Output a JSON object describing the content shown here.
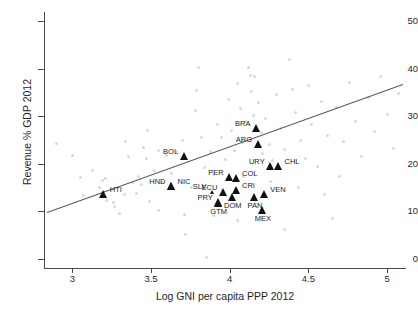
{
  "chart_data": {
    "type": "scatter",
    "title": "",
    "xlabel": "Log GNI per capita PPP 2012",
    "ylabel": "Revenue % GDP 2012",
    "xlim": [
      2.82,
      5.12
    ],
    "ylim": [
      -2.0,
      52.0
    ],
    "xticks": [
      3,
      3.5,
      4,
      4.5,
      5
    ],
    "xticklabels": [
      "3",
      "3.5",
      "4",
      "4.5",
      "5"
    ],
    "yticks": [
      0,
      10,
      20,
      30,
      40,
      50
    ],
    "yticklabels": [
      "0",
      "10",
      "20",
      "30",
      "40",
      "50"
    ],
    "grid": false,
    "legend": "none",
    "series": [
      {
        "name": "Latin America & Caribbean (labeled)",
        "marker": "triangle",
        "color": "#111111",
        "points": [
          {
            "label": "HTI",
            "x": 3.2,
            "y": 12.9,
            "label_pos": "right"
          },
          {
            "label": "BOL",
            "x": 3.71,
            "y": 21.0,
            "label_pos": "left"
          },
          {
            "label": "HND",
            "x": 3.63,
            "y": 14.7,
            "label_pos": "left"
          },
          {
            "label": "NIC",
            "x": 3.63,
            "y": 14.7,
            "label_pos": "right"
          },
          {
            "label": "SLV",
            "x": 3.89,
            "y": 13.6,
            "label_pos": "left",
            "size": "small"
          },
          {
            "label": "PRY",
            "x": 3.93,
            "y": 11.2,
            "label_pos": "left"
          },
          {
            "label": "GTM",
            "x": 3.93,
            "y": 11.0,
            "label_pos": "below"
          },
          {
            "label": "ECU",
            "x": 3.96,
            "y": 13.5,
            "label_pos": "left"
          },
          {
            "label": "PER",
            "x": 4.0,
            "y": 16.6,
            "label_pos": "left"
          },
          {
            "label": "COL",
            "x": 4.04,
            "y": 16.3,
            "label_pos": "right"
          },
          {
            "label": "CRI",
            "x": 4.04,
            "y": 13.8,
            "label_pos": "right"
          },
          {
            "label": "DOM",
            "x": 4.02,
            "y": 12.4,
            "label_pos": "below"
          },
          {
            "label": "BRA",
            "x": 4.17,
            "y": 26.9,
            "label_pos": "left"
          },
          {
            "label": "ARG",
            "x": 4.18,
            "y": 23.5,
            "label_pos": "left"
          },
          {
            "label": "URY",
            "x": 4.26,
            "y": 18.8,
            "label_pos": "left"
          },
          {
            "label": "CHL",
            "x": 4.31,
            "y": 18.8,
            "label_pos": "right"
          },
          {
            "label": "PAN",
            "x": 4.16,
            "y": 12.3,
            "label_pos": "below"
          },
          {
            "label": "VEN",
            "x": 4.22,
            "y": 13.0,
            "label_pos": "right"
          },
          {
            "label": "MEX",
            "x": 4.21,
            "y": 9.6,
            "label_pos": "below"
          }
        ]
      },
      {
        "name": "All other countries",
        "marker": "dot",
        "color": "#d8d8d8",
        "points": [
          {
            "x": 2.9,
            "y": 24.3
          },
          {
            "x": 3.0,
            "y": 21.7
          },
          {
            "x": 3.05,
            "y": 17.0
          },
          {
            "x": 3.07,
            "y": 13.2
          },
          {
            "x": 3.13,
            "y": 18.6
          },
          {
            "x": 3.17,
            "y": 15.0
          },
          {
            "x": 3.19,
            "y": 16.4
          },
          {
            "x": 3.21,
            "y": 16.8
          },
          {
            "x": 3.22,
            "y": 12.2
          },
          {
            "x": 3.26,
            "y": 11.9
          },
          {
            "x": 3.27,
            "y": 11.0
          },
          {
            "x": 3.3,
            "y": 9.6
          },
          {
            "x": 3.33,
            "y": 13.5
          },
          {
            "x": 3.36,
            "y": 21.5
          },
          {
            "x": 3.38,
            "y": 16.0
          },
          {
            "x": 3.41,
            "y": 13.8
          },
          {
            "x": 3.42,
            "y": 17.3
          },
          {
            "x": 3.44,
            "y": 15.6
          },
          {
            "x": 3.47,
            "y": 21.2
          },
          {
            "x": 3.49,
            "y": 12.0
          },
          {
            "x": 3.52,
            "y": 18.6
          },
          {
            "x": 3.55,
            "y": 10.2
          },
          {
            "x": 3.57,
            "y": 16.1
          },
          {
            "x": 3.6,
            "y": 21.7
          },
          {
            "x": 3.63,
            "y": 17.9
          },
          {
            "x": 3.66,
            "y": 22.5
          },
          {
            "x": 3.7,
            "y": 24.9
          },
          {
            "x": 3.72,
            "y": 5.0
          },
          {
            "x": 3.76,
            "y": 14.9
          },
          {
            "x": 3.78,
            "y": 31.3
          },
          {
            "x": 3.79,
            "y": 35.4
          },
          {
            "x": 3.8,
            "y": 40.2
          },
          {
            "x": 3.82,
            "y": 25.6
          },
          {
            "x": 3.84,
            "y": 19.1
          },
          {
            "x": 3.85,
            "y": 0.3
          },
          {
            "x": 3.88,
            "y": 22.5
          },
          {
            "x": 3.9,
            "y": 17.8
          },
          {
            "x": 3.92,
            "y": 28.2
          },
          {
            "x": 3.95,
            "y": 25.5
          },
          {
            "x": 3.97,
            "y": 20.9
          },
          {
            "x": 3.99,
            "y": 33.5
          },
          {
            "x": 4.01,
            "y": 27.0
          },
          {
            "x": 4.03,
            "y": 22.8
          },
          {
            "x": 4.05,
            "y": 37.0
          },
          {
            "x": 4.07,
            "y": 31.6
          },
          {
            "x": 4.08,
            "y": 24.4
          },
          {
            "x": 4.1,
            "y": 28.8
          },
          {
            "x": 4.12,
            "y": 40.3
          },
          {
            "x": 4.13,
            "y": 38.7
          },
          {
            "x": 4.14,
            "y": 35.2
          },
          {
            "x": 4.15,
            "y": 30.1
          },
          {
            "x": 4.16,
            "y": 38.3
          },
          {
            "x": 4.18,
            "y": 33.0
          },
          {
            "x": 4.2,
            "y": 26.6
          },
          {
            "x": 4.21,
            "y": 22.2
          },
          {
            "x": 4.23,
            "y": 29.5
          },
          {
            "x": 4.25,
            "y": 24.0
          },
          {
            "x": 4.27,
            "y": 20.6
          },
          {
            "x": 4.3,
            "y": 34.5
          },
          {
            "x": 4.32,
            "y": 27.4
          },
          {
            "x": 4.35,
            "y": 23.1
          },
          {
            "x": 4.38,
            "y": 41.9
          },
          {
            "x": 4.4,
            "y": 35.7
          },
          {
            "x": 4.42,
            "y": 30.9
          },
          {
            "x": 4.45,
            "y": 24.8
          },
          {
            "x": 4.48,
            "y": 21.0
          },
          {
            "x": 4.5,
            "y": 36.4
          },
          {
            "x": 4.52,
            "y": 28.3
          },
          {
            "x": 4.56,
            "y": 19.4
          },
          {
            "x": 4.58,
            "y": 33.1
          },
          {
            "x": 4.62,
            "y": 26.0
          },
          {
            "x": 4.65,
            "y": 8.4
          },
          {
            "x": 4.68,
            "y": 31.8
          },
          {
            "x": 4.72,
            "y": 24.6
          },
          {
            "x": 4.76,
            "y": 37.2
          },
          {
            "x": 4.8,
            "y": 29.0
          },
          {
            "x": 4.84,
            "y": 21.5
          },
          {
            "x": 4.88,
            "y": 34.0
          },
          {
            "x": 4.92,
            "y": 26.8
          },
          {
            "x": 4.96,
            "y": 38.5
          },
          {
            "x": 5.0,
            "y": 30.4
          },
          {
            "x": 5.04,
            "y": 23.2
          },
          {
            "x": 5.07,
            "y": 34.8
          },
          {
            "x": 3.34,
            "y": 24.6
          },
          {
            "x": 3.45,
            "y": 23.4
          },
          {
            "x": 4.09,
            "y": 17.3
          },
          {
            "x": 4.26,
            "y": 16.2
          },
          {
            "x": 4.44,
            "y": 15.0
          },
          {
            "x": 4.6,
            "y": 13.6
          },
          {
            "x": 4.7,
            "y": 17.2
          },
          {
            "x": 3.9,
            "y": 9.0
          },
          {
            "x": 3.71,
            "y": 9.2
          },
          {
            "x": 4.35,
            "y": 6.2
          },
          {
            "x": 4.05,
            "y": 8.1
          },
          {
            "x": 3.55,
            "y": 22.8
          },
          {
            "x": 3.48,
            "y": 27.0
          }
        ]
      }
    ],
    "fit_line": {
      "name": "linear-fit",
      "color": "#5a5a5a",
      "x0": 2.84,
      "y0": 9.9,
      "x1": 5.1,
      "y1": 36.9
    }
  }
}
